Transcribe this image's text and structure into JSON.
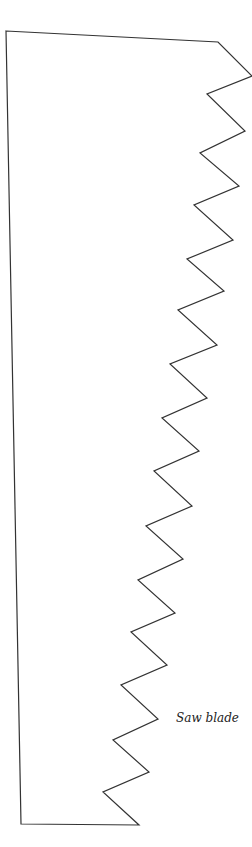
{
  "diagram": {
    "title": "Saw blade",
    "label": "Saw blade",
    "stroke_color": "#333333",
    "background": "#ffffff",
    "outline_points": [
      [
        6,
        31
      ],
      [
        218,
        42
      ],
      [
        252,
        76
      ],
      [
        207,
        94
      ],
      [
        245,
        131
      ],
      [
        200,
        153
      ],
      [
        239,
        186
      ],
      [
        194,
        205
      ],
      [
        233,
        240
      ],
      [
        187,
        259
      ],
      [
        224,
        291
      ],
      [
        178,
        310
      ],
      [
        217,
        345
      ],
      [
        170,
        364
      ],
      [
        207,
        398
      ],
      [
        162,
        418
      ],
      [
        199,
        451
      ],
      [
        154,
        471
      ],
      [
        192,
        506
      ],
      [
        146,
        526
      ],
      [
        183,
        559
      ],
      [
        138,
        580
      ],
      [
        175,
        613
      ],
      [
        131,
        632
      ],
      [
        167,
        665
      ],
      [
        121,
        685
      ],
      [
        158,
        719
      ],
      [
        113,
        740
      ],
      [
        149,
        772
      ],
      [
        103,
        792
      ],
      [
        139,
        825
      ],
      [
        21,
        824
      ]
    ],
    "tooth_count": 15
  }
}
